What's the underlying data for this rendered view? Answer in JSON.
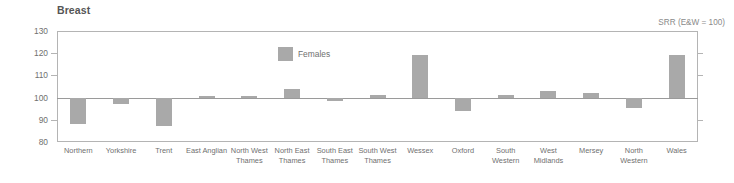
{
  "chart": {
    "title": "Breast",
    "units_note": "SRR (E&W = 100)",
    "legend": {
      "label": "Females",
      "swatch_name": "legend-swatch-females",
      "color": "#a9a9a9"
    }
  },
  "chart_data": {
    "type": "bar",
    "title": "Breast",
    "subtitle": "SRR (E&W = 100)",
    "xlabel": "",
    "ylabel": "",
    "ylim": [
      80,
      130
    ],
    "yticks": [
      80,
      90,
      100,
      110,
      120,
      130
    ],
    "baseline": 100,
    "grid": false,
    "legend_position": "inside-top-center",
    "bar_color": "#a9a9a9",
    "categories": [
      "Northern",
      "Yorkshire",
      "Trent",
      "East Anglian",
      "North West Thames",
      "North East Thames",
      "South East Thames",
      "South West Thames",
      "Wessex",
      "Oxford",
      "South Western",
      "West Midlands",
      "Mersey",
      "North Western",
      "Wales"
    ],
    "category_lines": [
      [
        "Northern"
      ],
      [
        "Yorkshire"
      ],
      [
        "Trent"
      ],
      [
        "East Anglian"
      ],
      [
        "North West",
        "Thames"
      ],
      [
        "North East",
        "Thames"
      ],
      [
        "South East",
        "Thames"
      ],
      [
        "South West",
        "Thames"
      ],
      [
        "Wessex"
      ],
      [
        "Oxford"
      ],
      [
        "South",
        "Western"
      ],
      [
        "West",
        "Midlands"
      ],
      [
        "Mersey"
      ],
      [
        "North Western"
      ],
      [
        "Wales"
      ]
    ],
    "series": [
      {
        "name": "Females",
        "values": [
          88,
          97,
          87,
          100.5,
          100.5,
          104,
          98.5,
          101,
          119,
          94,
          101,
          103,
          102,
          95.5,
          119
        ]
      }
    ]
  }
}
